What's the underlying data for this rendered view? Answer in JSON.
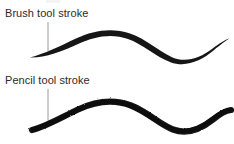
{
  "figure": {
    "width": 234,
    "height": 144,
    "background_color": "#ffffff",
    "ink_color": "#161616",
    "text_color": "#2b2b2b",
    "leader_line_color": "#8e8e8e"
  },
  "annotations": [
    {
      "id": "brush",
      "label": "Brush tool stroke",
      "label_x": 5,
      "label_y": 7,
      "leader_line": {
        "x1": 48,
        "y1": 22,
        "x2": 48,
        "y2": 51
      }
    },
    {
      "id": "pencil",
      "label": "Pencil tool stroke",
      "label_x": 5,
      "label_y": 74,
      "leader_line": {
        "x1": 48,
        "y1": 89,
        "x2": 48,
        "y2": 122
      }
    }
  ],
  "strokes": [
    {
      "id": "brush-stroke",
      "name": "Brush tool stroke",
      "edge_quality": "soft-antialiased-tapered",
      "start_point": {
        "x": 30,
        "y": 57
      },
      "end_point": {
        "x": 229,
        "y": 39
      },
      "max_thickness": 9,
      "min_thickness": 0
    },
    {
      "id": "pencil-stroke",
      "name": "Pencil tool stroke",
      "edge_quality": "hard-aliased-uniform",
      "start_point": {
        "x": 32,
        "y": 130
      },
      "end_point": {
        "x": 231,
        "y": 110
      },
      "max_thickness": 7,
      "min_thickness": 3
    }
  ]
}
